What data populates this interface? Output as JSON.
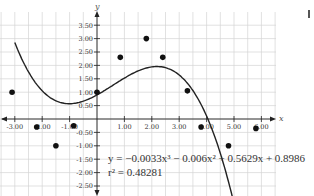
{
  "chart_data": {
    "type": "scatter",
    "title": "",
    "xlabel": "x",
    "ylabel": "y",
    "xlim": [
      -3.5,
      6.5
    ],
    "ylim": [
      -2.85,
      4.0
    ],
    "grid": true,
    "grid_step": 0.5,
    "x_ticks": [
      -3.0,
      -2.0,
      -1.0,
      1.0,
      2.0,
      3.0,
      4.0,
      5.0,
      6.0
    ],
    "x_tick_labels": [
      "-3.00",
      "-2.00",
      "-1.00",
      "1.00",
      "2.00",
      "3.00",
      "4.00",
      "5.00",
      "6.00"
    ],
    "y_ticks": [
      3.5,
      3.0,
      2.5,
      2.0,
      1.5,
      1.0,
      0.5,
      -0.5,
      -1.0,
      -1.5,
      -2.0,
      -2.5
    ],
    "y_tick_labels": [
      "3.50",
      "3.00",
      "2.50",
      "2.00",
      "1.50",
      "1.00",
      "0.50",
      "-0.50",
      "-1.00",
      "-1.50",
      "-2.00",
      "-2.50"
    ],
    "series": [
      {
        "name": "data points",
        "type": "scatter",
        "x": [
          -3.1,
          -2.2,
          -1.5,
          -0.85,
          0.0,
          0.85,
          1.8,
          2.4,
          3.3,
          3.8,
          4.8,
          5.8
        ],
        "y": [
          1.0,
          -0.3,
          -1.0,
          -0.25,
          1.0,
          2.3,
          3.0,
          2.3,
          1.05,
          -0.3,
          -1.0,
          -0.35
        ]
      },
      {
        "name": "cubic regression",
        "type": "line",
        "coefficients": {
          "a": -0.0033,
          "b": -0.006,
          "c": 0.5629,
          "d": 0.8986
        },
        "x_range": [
          -3.0,
          5.1
        ]
      }
    ],
    "annotations": [
      {
        "text": "y = −0.0033x³ − 0.006x² + 0.5629x + 0.8986"
      },
      {
        "text": "r² = 0.48281"
      }
    ]
  },
  "equation": {
    "line1": "y = −0.0033x³ − 0.006x² + 0.5629x + 0.8986",
    "line2": "r² = 0.48281"
  },
  "axes": {
    "x_name": "x",
    "y_name": "y"
  },
  "colors": {
    "grid": "#d4d4d4",
    "axis": "#222222",
    "point": "#111111",
    "curve": "#222222"
  }
}
